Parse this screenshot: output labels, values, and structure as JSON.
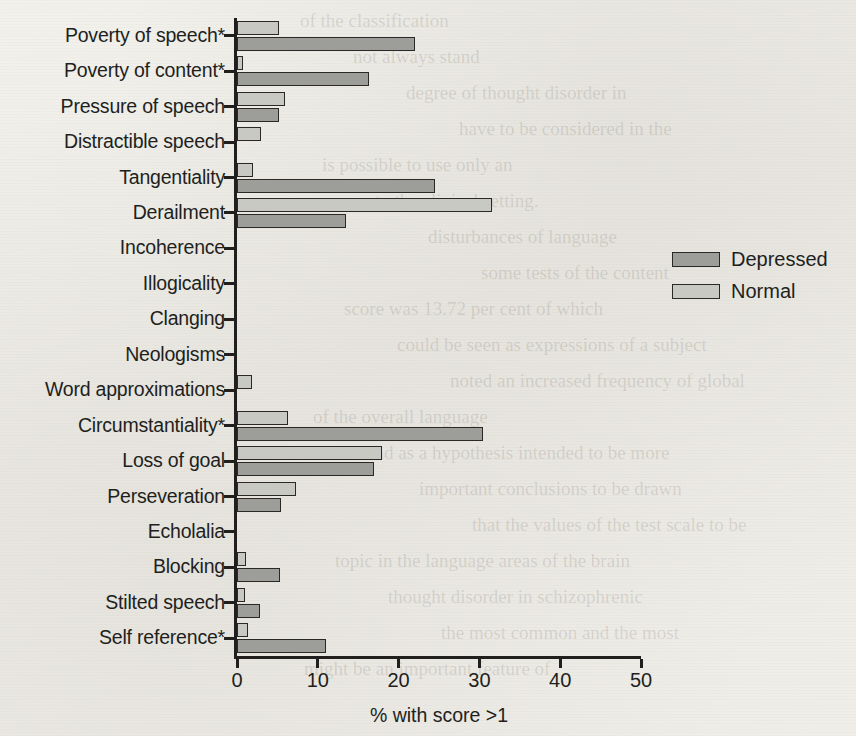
{
  "chart_data": {
    "type": "bar",
    "orientation": "horizontal",
    "title": "",
    "xlabel": "% with score >1",
    "ylabel": "",
    "xlim": [
      0,
      50
    ],
    "xticks": [
      0,
      10,
      20,
      30,
      40,
      50
    ],
    "xtick_labels": [
      "0",
      "10",
      "20",
      "30",
      "40",
      "50"
    ],
    "grid": false,
    "legend_position": "right",
    "categories": [
      "Poverty of speech*",
      "Poverty of content*",
      "Pressure of speech",
      "Distractible speech",
      "Tangentiality",
      "Derailment",
      "Incoherence",
      "Illogicality",
      "Clanging",
      "Neologisms",
      "Word approximations",
      "Circumstantiality*",
      "Loss of goal",
      "Perseveration",
      "Echolalia",
      "Blocking",
      "Stilted speech",
      "Self reference*"
    ],
    "series": [
      {
        "name": "Depressed",
        "color": "#9d9d99",
        "values": [
          22.0,
          16.3,
          5.2,
          0.0,
          24.5,
          13.5,
          0.0,
          0.0,
          0.0,
          0.0,
          0.0,
          30.5,
          17.0,
          5.5,
          0.0,
          5.3,
          2.8,
          11.0
        ]
      },
      {
        "name": "Normal",
        "color": "#c9c9c3",
        "values": [
          5.2,
          0.8,
          6.0,
          3.0,
          2.0,
          31.5,
          0.0,
          0.0,
          0.0,
          0.0,
          1.8,
          6.3,
          18.0,
          7.3,
          0.0,
          1.1,
          1.0,
          1.3
        ]
      }
    ]
  },
  "legend": {
    "entries": [
      {
        "label": "Depressed",
        "swatch": "depressed"
      },
      {
        "label": "Normal",
        "swatch": "normal"
      }
    ]
  },
  "page_bleed": {
    "lines": [
      "of the classification",
      "not always stand",
      "degree of thought disorder in",
      "have to be considered in the",
      "is possible to use only an",
      "to the clinical setting.",
      "disturbances of language",
      "some tests of the content",
      "score was 13.72 per cent of which",
      "could be seen as expressions of a subject",
      "noted an increased frequency of global",
      "of the overall language",
      "and as a hypothesis intended to be more",
      "important conclusions to be drawn",
      "that the values of the test scale to be",
      "topic in the language areas of the brain",
      "thought disorder in schizophrenic",
      "the most common and the most",
      "might be an important feature of"
    ]
  }
}
